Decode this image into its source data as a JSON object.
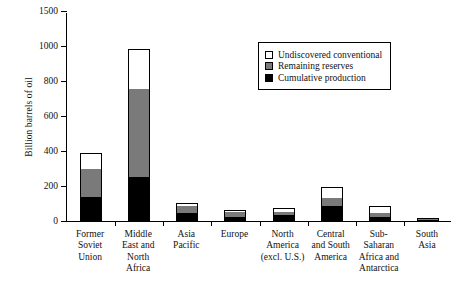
{
  "chart_data": {
    "type": "bar",
    "title": "",
    "xlabel": "",
    "ylabel": "Billion barrels of oil",
    "ylim": [
      0,
      1500
    ],
    "yticks": [
      0,
      200,
      400,
      600,
      800,
      1000,
      1500
    ],
    "ytick_labels": [
      "0",
      "200",
      "400",
      "600",
      "800",
      "1000",
      "1500"
    ],
    "axis_break_note": "linear 0-1000; break between 1000 and 1500",
    "grid": false,
    "legend_position": "upper right",
    "stacked": true,
    "categories": [
      "Former Soviet Union",
      "Middle East and North Africa",
      "Asia Pacific",
      "Europe",
      "North America (excl. U.S.)",
      "Central and South America",
      "Sub-Saharan Africa and Antarctica",
      "South Asia"
    ],
    "category_labels_multiline": [
      "Former\nSoviet\nUnion",
      "Middle\nEast and\nNorth\nAfrica",
      "Asia\nPacific",
      "Europe",
      "North\nAmerica\n(excl. U.S.)",
      "Central\nand South\nAmerica",
      "Sub-\nSaharan\nAfrica and\nAntarctica",
      "South\nAsia"
    ],
    "series": [
      {
        "name": "Cumulative production",
        "color": "#000000",
        "values": [
          137,
          252,
          45,
          25,
          33,
          85,
          22,
          5
        ]
      },
      {
        "name": "Remaining reserves",
        "color": "#7a7a7a",
        "values": [
          160,
          503,
          40,
          25,
          20,
          45,
          25,
          5
        ]
      },
      {
        "name": "Undiscovered conventional",
        "color": "#ffffff",
        "values": [
          93,
          230,
          18,
          15,
          22,
          65,
          38,
          2
        ]
      }
    ],
    "totals": [
      390,
      985,
      103,
      65,
      75,
      195,
      85,
      12
    ]
  },
  "legend": {
    "entries": [
      {
        "label": "Undiscovered conventional",
        "swatch": "white-swatch"
      },
      {
        "label": "Remaining reserves",
        "swatch": "gray-swatch"
      },
      {
        "label": "Cumulative production",
        "swatch": "black-swatch"
      }
    ]
  }
}
